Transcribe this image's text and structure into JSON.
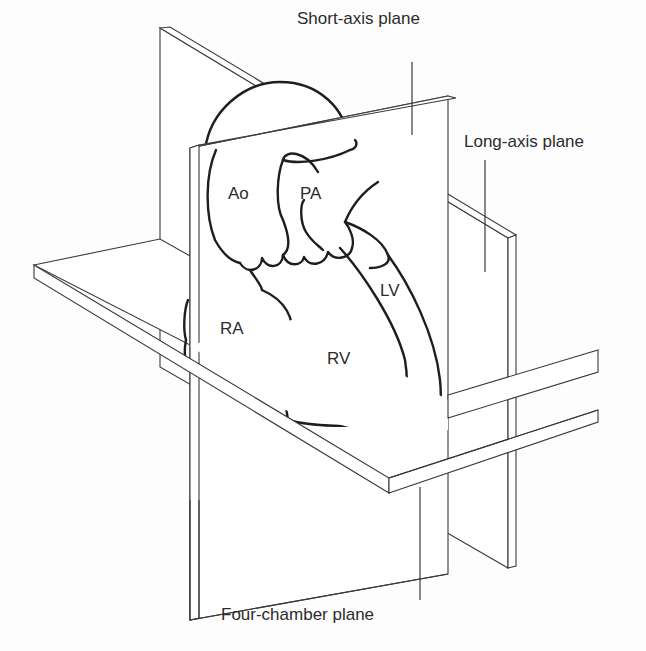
{
  "figure": {
    "labels": {
      "short_axis": "Short-axis plane",
      "long_axis": "Long-axis plane",
      "four_chamber": "Four-chamber plane"
    },
    "chambers": {
      "ao": "Ao",
      "pa": "PA",
      "ra": "RA",
      "rv": "RV",
      "lv": "LV"
    },
    "colors": {
      "line": "#3a3a3a",
      "heart_outline": "#1e1e1e",
      "text": "#2c2c2c",
      "background": "#ffffff"
    }
  }
}
